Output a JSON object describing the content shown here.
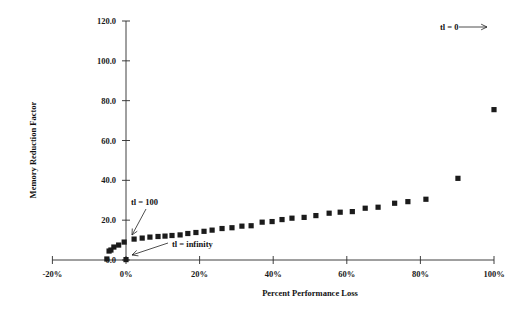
{
  "chart_data": {
    "type": "scatter",
    "title": "",
    "xlabel": "Percent Performance Loss",
    "ylabel": "Memory Reduction Factor",
    "xlim": [
      -20,
      100
    ],
    "ylim": [
      0,
      120
    ],
    "xtick_labels": [
      "-20%",
      "0%",
      "20%",
      "40%",
      "60%",
      "80%",
      "100%"
    ],
    "xtick_values": [
      -20,
      0,
      20,
      40,
      60,
      80,
      100
    ],
    "ytick_labels": [
      "0.0",
      "20.0",
      "40.0",
      "60.0",
      "80.0",
      "100.0",
      "120.0"
    ],
    "ytick_values": [
      0,
      20,
      40,
      60,
      80,
      100,
      120
    ],
    "grid": false,
    "legend": "none",
    "marker": "filled-square",
    "marker_color": "#1b1b1b",
    "series": [
      {
        "name": "memory reduction factor",
        "points": [
          [
            -5.2,
            0.5
          ],
          [
            -4.6,
            4.5
          ],
          [
            -4.1,
            5.0
          ],
          [
            -3.3,
            6.5
          ],
          [
            -2.0,
            7.5
          ],
          [
            -0.5,
            9.0
          ],
          [
            0.0,
            0.2
          ],
          [
            2.2,
            10.5
          ],
          [
            4.4,
            11.0
          ],
          [
            6.5,
            11.5
          ],
          [
            8.7,
            11.8
          ],
          [
            10.6,
            12.0
          ],
          [
            12.5,
            12.3
          ],
          [
            14.7,
            12.6
          ],
          [
            16.8,
            13.3
          ],
          [
            19.0,
            13.8
          ],
          [
            21.2,
            14.4
          ],
          [
            23.4,
            15.0
          ],
          [
            26.1,
            15.8
          ],
          [
            28.8,
            16.2
          ],
          [
            31.5,
            17.0
          ],
          [
            34.0,
            17.2
          ],
          [
            37.0,
            19.0
          ],
          [
            39.7,
            19.3
          ],
          [
            42.4,
            20.3
          ],
          [
            45.1,
            21.0
          ],
          [
            48.4,
            21.4
          ],
          [
            51.6,
            22.3
          ],
          [
            55.2,
            23.5
          ],
          [
            58.2,
            24.0
          ],
          [
            61.5,
            24.3
          ],
          [
            65.0,
            26.0
          ],
          [
            68.5,
            26.5
          ],
          [
            73.0,
            28.5
          ],
          [
            76.6,
            29.3
          ],
          [
            81.5,
            30.5
          ],
          [
            90.2,
            41.0
          ],
          [
            100.0,
            75.5
          ]
        ]
      }
    ],
    "annotations": [
      {
        "id": "tl-zero",
        "label": "tl = 0",
        "label_x": 440,
        "label_y": 30,
        "arrow_from_x": 459,
        "arrow_from_y": 27,
        "arrow_to_x": 487,
        "arrow_to_y": 27,
        "describes": "topmost data point at 100% performance loss"
      },
      {
        "id": "tl-hundred",
        "label": "tl = 100",
        "label_x": 131,
        "label_y": 205,
        "arrow_from_x": 146,
        "arrow_from_y": 209,
        "arrow_to_x": 132,
        "arrow_to_y": 235,
        "describes": "lower-left portion of the data series"
      },
      {
        "id": "tl-infinity",
        "label": "tl = infinity",
        "label_x": 172,
        "label_y": 247,
        "arrow_from_x": 168,
        "arrow_from_y": 243,
        "arrow_to_x": 132,
        "arrow_to_y": 255,
        "describes": "point at the origin near 0% loss"
      }
    ]
  },
  "axes": {
    "x_axis_name": "percent-performance-loss-axis",
    "y_axis_name": "memory-reduction-factor-axis"
  }
}
